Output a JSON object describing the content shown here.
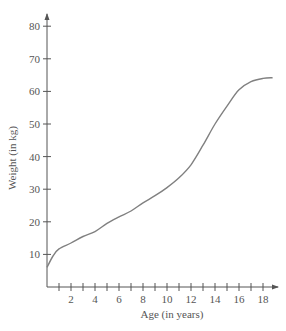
{
  "chart_data": {
    "type": "line",
    "title": "",
    "xlabel": "Age (in years)",
    "ylabel": "Weight (in kg)",
    "xlim": [
      0,
      19
    ],
    "ylim": [
      0,
      85
    ],
    "x_ticks": [
      2,
      4,
      6,
      8,
      10,
      12,
      14,
      16,
      18
    ],
    "y_ticks": [
      10,
      20,
      30,
      40,
      50,
      60,
      70,
      80
    ],
    "grid": false,
    "line_color": "#808080",
    "series": [
      {
        "name": "Weight",
        "x": [
          0,
          0.5,
          1,
          2,
          3,
          4,
          5,
          6,
          7,
          8,
          9,
          10,
          11,
          12,
          13,
          14,
          15,
          16,
          17,
          18,
          18.8
        ],
        "values": [
          6,
          9.5,
          11.7,
          13.5,
          15.5,
          17,
          19.5,
          21.5,
          23.3,
          25.8,
          28,
          30.5,
          33.5,
          37.5,
          43.5,
          50,
          55.5,
          60.5,
          63,
          64,
          64.2
        ]
      }
    ]
  }
}
